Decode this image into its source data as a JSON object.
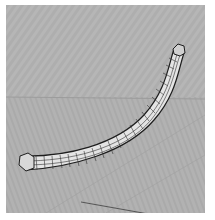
{
  "viewport": {
    "name": "3d-perspective-viewport",
    "background_color": "#b4b4b4",
    "ground_color": "#afafaf",
    "horizon_y": 92,
    "object": {
      "type": "swept-tube-wireframe",
      "shading": "#e6e6e6",
      "edge_color": "#222222"
    },
    "axis_line_color": "#555555"
  }
}
